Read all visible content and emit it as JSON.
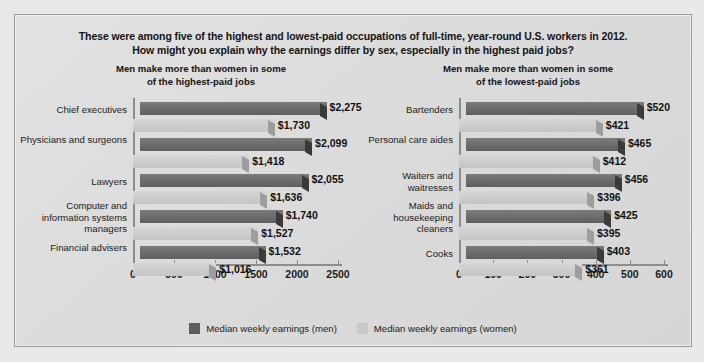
{
  "heading": {
    "line1": "These were among five of the highest and lowest-paid occupations of full-time, year-round U.S. workers in 2012.",
    "line2": "How might you explain why the earnings differ by sex, especially in the highest paid jobs?"
  },
  "legend": {
    "men_label": "Median weekly earnings (men)",
    "women_label": "Median weekly earnings (women)",
    "men_color": "#5f5f5f",
    "women_color": "#c9c9c9"
  },
  "panels": {
    "left": {
      "title_line1": "Men make more than women in some",
      "title_line2": "of the highest-paid jobs"
    },
    "right": {
      "title_line1": "Men make more than women in some",
      "title_line2": "of the lowest-paid jobs"
    }
  },
  "chart_data": [
    {
      "type": "bar",
      "orientation": "horizontal",
      "title": "Men make more than women in some of the highest-paid jobs",
      "xlabel": "",
      "ylabel": "",
      "xlim": [
        0,
        2500
      ],
      "xticks": [
        0,
        500,
        1000,
        1500,
        2000,
        2500
      ],
      "xticklabels": [
        "0",
        "500",
        "1000",
        "1500",
        "2000",
        "2500"
      ],
      "grid": false,
      "legend_position": "bottom",
      "categories": [
        "Chief executives",
        "Physicians and surgeons",
        "Lawyers",
        "Computer and information systems managers",
        "Financial advisers"
      ],
      "series": [
        {
          "name": "Median weekly earnings (men)",
          "values": [
            2275,
            2099,
            2055,
            1740,
            1532
          ],
          "labels": [
            "$2,275",
            "$2,099",
            "$2,055",
            "$1,740",
            "$1,532"
          ]
        },
        {
          "name": "Median weekly earnings (women)",
          "values": [
            1730,
            1418,
            1636,
            1527,
            1016
          ],
          "labels": [
            "$1,730",
            "$1,418",
            "$1,636",
            "$1,527",
            "$1,016"
          ]
        }
      ]
    },
    {
      "type": "bar",
      "orientation": "horizontal",
      "title": "Men make more than women in some of the lowest-paid jobs",
      "xlabel": "",
      "ylabel": "",
      "xlim": [
        0,
        600
      ],
      "xticks": [
        0,
        100,
        200,
        300,
        400,
        500,
        600
      ],
      "xticklabels": [
        "0",
        "100",
        "200",
        "300",
        "400",
        "500",
        "600"
      ],
      "grid": false,
      "legend_position": "bottom",
      "categories": [
        "Bartenders",
        "Personal care aides",
        "Waiters and waitresses",
        "Maids and housekeeping cleaners",
        "Cooks"
      ],
      "series": [
        {
          "name": "Median weekly earnings (men)",
          "values": [
            520,
            465,
            456,
            425,
            403
          ],
          "labels": [
            "$520",
            "$465",
            "$456",
            "$425",
            "$403"
          ]
        },
        {
          "name": "Median weekly earnings (women)",
          "values": [
            421,
            412,
            396,
            395,
            361
          ],
          "labels": [
            "$421",
            "$412",
            "$396",
            "$395",
            "$361"
          ]
        }
      ]
    }
  ]
}
